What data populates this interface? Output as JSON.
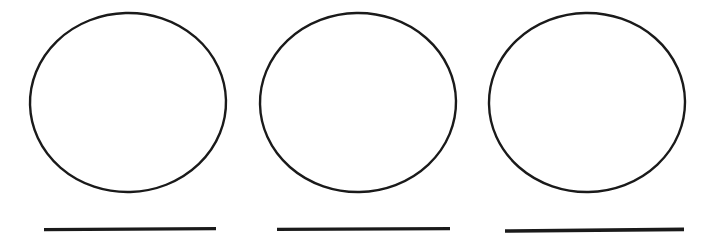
{
  "document": {
    "title": "Three circles with underlines worksheet",
    "background_color": "#ffffff",
    "width": 719,
    "height": 241
  },
  "figure": {
    "type": "line-art",
    "stroke_color": "#1a1a1a",
    "fill_color": "none",
    "item_count": 3
  },
  "items": [
    {
      "index": 1,
      "label": "item-1",
      "circle": {
        "cx": 128,
        "cy": 102.5,
        "rx": 98,
        "ry": 89.5,
        "stroke_width": 2.4,
        "rotation": -1.5
      },
      "underline": {
        "x1": 44,
        "x2": 216,
        "y": 229,
        "stroke_width": 3.4,
        "length": 172
      }
    },
    {
      "index": 2,
      "label": "item-2",
      "circle": {
        "cx": 358,
        "cy": 102.5,
        "rx": 98,
        "ry": 89.5,
        "stroke_width": 2.4,
        "rotation": -1.0
      },
      "underline": {
        "x1": 277,
        "x2": 450,
        "y": 229,
        "stroke_width": 3.4,
        "length": 173
      }
    },
    {
      "index": 3,
      "label": "item-3",
      "circle": {
        "cx": 587,
        "cy": 102.5,
        "rx": 98,
        "ry": 89.5,
        "stroke_width": 2.4,
        "rotation": -1.0
      },
      "underline": {
        "x1": 505,
        "x2": 684,
        "y": 230,
        "stroke_width": 3.6,
        "length": 179
      }
    }
  ]
}
